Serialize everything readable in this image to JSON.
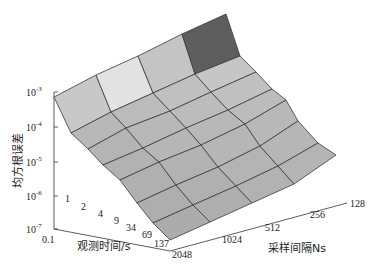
{
  "chart_data": {
    "type": "surface3d",
    "title": "",
    "xlabel": "观测时间/s",
    "ylabel": "采样间隔Ns",
    "zlabel": "均方根误差",
    "x_ticks": [
      "0.1",
      "1",
      "2",
      "4",
      "9",
      "34",
      "69",
      "137"
    ],
    "y_ticks": [
      "2048",
      "1024",
      "512",
      "256",
      "128"
    ],
    "z_ticks": [
      "10^-7",
      "10^-6",
      "10^-5",
      "10^-4",
      "10^-3"
    ],
    "z_scale": "log",
    "zlim": [
      "1e-7",
      "1e-3"
    ],
    "grid": false,
    "colormap": "gray (value-dependent shading)",
    "surface_log10_rmse": {
      "rows_observation_time": [
        "0.1",
        "1",
        "2",
        "4",
        "9",
        "34",
        "69",
        "137"
      ],
      "cols_sampling_interval": [
        "2048",
        "1024",
        "512",
        "256",
        "128"
      ],
      "values": [
        [
          -4.2,
          -3.9,
          -3.7,
          -3.4,
          -3.0
        ],
        [
          -5.0,
          -4.4,
          -4.3,
          -4.1,
          -3.9
        ],
        [
          -5.2,
          -5.0,
          -4.8,
          -4.6,
          -4.4
        ],
        [
          -5.5,
          -5.3,
          -5.2,
          -4.9,
          -4.8
        ],
        [
          -5.8,
          -5.6,
          -5.4,
          -5.3,
          -5.1
        ],
        [
          -6.2,
          -6.0,
          -5.8,
          -5.6,
          -5.5
        ],
        [
          -6.5,
          -6.3,
          -6.1,
          -6.0,
          -5.8
        ],
        [
          -6.8,
          -6.6,
          -6.4,
          -6.3,
          -6.1
        ]
      ]
    }
  },
  "axes": {
    "z_axis": {
      "label": "均方根误差",
      "ticks": [
        {
          "base": "10",
          "exp": "-7",
          "y": 229
        },
        {
          "base": "10",
          "exp": "-6",
          "y": 196
        },
        {
          "base": "10",
          "exp": "-5",
          "y": 162
        },
        {
          "base": "10",
          "exp": "-4",
          "y": 127
        },
        {
          "base": "10",
          "exp": "-3",
          "y": 92
        }
      ]
    },
    "x_axis": {
      "label": "观测时间/s",
      "ticks": [
        {
          "text": "0.1",
          "x": 42,
          "y": 243
        },
        {
          "text": "1",
          "x": 65,
          "y": 202
        },
        {
          "text": "2",
          "x": 81,
          "y": 210
        },
        {
          "text": "4",
          "x": 98,
          "y": 217
        },
        {
          "text": "9",
          "x": 114,
          "y": 224
        },
        {
          "text": "34",
          "x": 126,
          "y": 231
        },
        {
          "text": "69",
          "x": 142,
          "y": 238
        },
        {
          "text": "137",
          "x": 154,
          "y": 247
        }
      ]
    },
    "y_axis": {
      "label": "采样间隔Ns",
      "ticks": [
        {
          "text": "2048",
          "x": 172,
          "y": 258
        },
        {
          "text": "1024",
          "x": 222,
          "y": 243
        },
        {
          "text": "512",
          "x": 265,
          "y": 231
        },
        {
          "text": "256",
          "x": 310,
          "y": 218
        },
        {
          "text": "128",
          "x": 350,
          "y": 207
        }
      ]
    }
  },
  "mesh": {
    "vertices": [
      [
        [
          54,
          97
        ],
        [
          96,
          75
        ],
        [
          138,
          56
        ],
        [
          182,
          34
        ],
        [
          226,
          14
        ]
      ],
      [
        [
          71,
          133
        ],
        [
          111,
          112
        ],
        [
          153,
          93
        ],
        [
          195,
          74
        ],
        [
          240,
          56
        ]
      ],
      [
        [
          88,
          149
        ],
        [
          126,
          128
        ],
        [
          170,
          111
        ],
        [
          211,
          92
        ],
        [
          256,
          72
        ]
      ],
      [
        [
          103,
          165
        ],
        [
          143,
          148
        ],
        [
          186,
          128
        ],
        [
          228,
          110
        ],
        [
          272,
          89
        ]
      ],
      [
        [
          120,
          180
        ],
        [
          159,
          162
        ],
        [
          201,
          145
        ],
        [
          245,
          124
        ],
        [
          286,
          100
        ]
      ],
      [
        [
          137,
          203
        ],
        [
          176,
          185
        ],
        [
          218,
          167
        ],
        [
          260,
          146
        ],
        [
          298,
          121
        ]
      ],
      [
        [
          153,
          223
        ],
        [
          193,
          205
        ],
        [
          236,
          186
        ],
        [
          278,
          166
        ],
        [
          318,
          143
        ]
      ],
      [
        [
          170,
          240
        ],
        [
          210,
          222
        ],
        [
          252,
          203
        ],
        [
          294,
          184
        ],
        [
          336,
          155
        ]
      ]
    ],
    "face_colors": [
      [
        "#c8c8c8",
        "#e2e2e2",
        "#c4c4c4",
        "#5e5e5e"
      ],
      [
        "#b8b8b8",
        "#bcbcbc",
        "#c0c0c0",
        "#c6c6c6"
      ],
      [
        "#b4b4b4",
        "#b8b8b8",
        "#bcbcbc",
        "#c0c0c0"
      ],
      [
        "#b2b2b2",
        "#b6b6b6",
        "#b8b8b8",
        "#bcbcbc"
      ],
      [
        "#b0b0b0",
        "#b2b2b2",
        "#b6b6b6",
        "#b8b8b8"
      ],
      [
        "#aeaeae",
        "#b0b0b0",
        "#b4b4b4",
        "#b6b6b6"
      ],
      [
        "#acacac",
        "#aeaeae",
        "#b2b2b2",
        "#b4b4b4"
      ]
    ],
    "edge_color": "#3a3a3a"
  }
}
